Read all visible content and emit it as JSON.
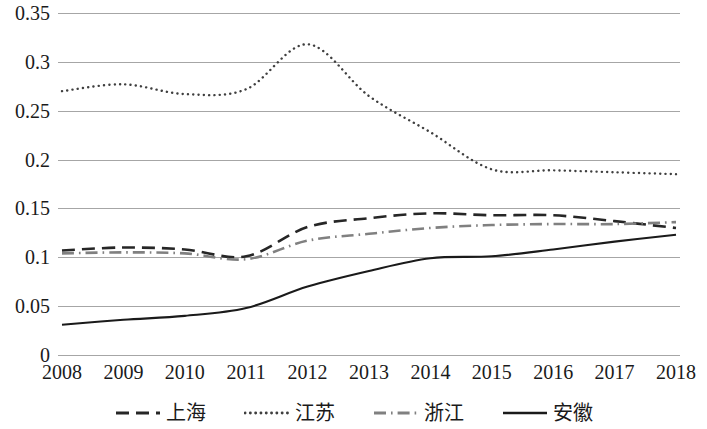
{
  "chart_data": {
    "type": "line",
    "title": "",
    "xlabel": "",
    "ylabel": "",
    "categories": [
      "2008",
      "2009",
      "2010",
      "2011",
      "2012",
      "2013",
      "2014",
      "2015",
      "2016",
      "2017",
      "2018"
    ],
    "x": [
      2008,
      2009,
      2010,
      2011,
      2012,
      2013,
      2014,
      2015,
      2016,
      2017,
      2018
    ],
    "ylim": [
      0,
      0.35
    ],
    "xlim": [
      2008,
      2018
    ],
    "y_ticks": [
      0,
      0.05,
      0.1,
      0.15,
      0.2,
      0.25,
      0.3,
      0.35
    ],
    "y_tick_labels": [
      "0",
      "0.05",
      "0.1",
      "0.15",
      "0.2",
      "0.25",
      "0.3",
      "0.35"
    ],
    "grid": true,
    "legend_position": "bottom",
    "series": [
      {
        "name": "上海",
        "style": "dashed",
        "color": "#262626",
        "values": [
          0.107,
          0.11,
          0.108,
          0.101,
          0.131,
          0.14,
          0.145,
          0.143,
          0.143,
          0.137,
          0.13
        ]
      },
      {
        "name": "江苏",
        "style": "dotted",
        "color": "#3f3f3f",
        "values": [
          0.27,
          0.277,
          0.267,
          0.272,
          0.318,
          0.265,
          0.228,
          0.19,
          0.189,
          0.187,
          0.185
        ]
      },
      {
        "name": "浙江",
        "style": "dash-dot",
        "color": "#808080",
        "values": [
          0.104,
          0.105,
          0.104,
          0.098,
          0.117,
          0.124,
          0.13,
          0.133,
          0.134,
          0.134,
          0.136
        ]
      },
      {
        "name": "安徽",
        "style": "solid",
        "color": "#1a1a1a",
        "values": [
          0.031,
          0.036,
          0.04,
          0.048,
          0.07,
          0.086,
          0.099,
          0.101,
          0.108,
          0.116,
          0.123
        ]
      }
    ]
  },
  "y_axis": {
    "ticks": [
      {
        "label": "0.35",
        "value": 0.35
      },
      {
        "label": "0.3",
        "value": 0.3
      },
      {
        "label": "0.25",
        "value": 0.25
      },
      {
        "label": "0.2",
        "value": 0.2
      },
      {
        "label": "0.15",
        "value": 0.15
      },
      {
        "label": "0.1",
        "value": 0.1
      },
      {
        "label": "0.05",
        "value": 0.05
      },
      {
        "label": "0",
        "value": 0
      }
    ]
  },
  "legend": {
    "items": [
      {
        "label": "上海",
        "style": "dashed"
      },
      {
        "label": "江苏",
        "style": "dotted"
      },
      {
        "label": "浙江",
        "style": "dash-dot"
      },
      {
        "label": "安徽",
        "style": "solid"
      }
    ]
  }
}
